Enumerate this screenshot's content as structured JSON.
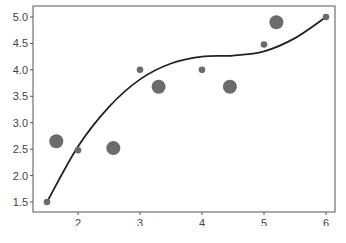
{
  "chart_data": {
    "type": "scatter",
    "title": "",
    "xlabel": "",
    "ylabel": "",
    "xlim": [
      1.3,
      6.2
    ],
    "ylim": [
      1.3,
      5.2
    ],
    "x_ticks": [
      2,
      3,
      4,
      5,
      6
    ],
    "x_tick_labels": [
      "2",
      "3",
      "4",
      "5",
      "6"
    ],
    "y_ticks": [
      1.5,
      2.0,
      2.5,
      3.0,
      3.5,
      4.0,
      4.5,
      5.0
    ],
    "y_tick_labels": [
      "1.5",
      "2.0",
      "2.5",
      "3.0",
      "3.5",
      "4.0",
      "4.5",
      "5.0"
    ],
    "grid": false,
    "legend": null,
    "series": [
      {
        "name": "points",
        "type": "scatter",
        "color": "#6b6b6b",
        "points": [
          {
            "x": 1.5,
            "y": 1.5,
            "size": "small"
          },
          {
            "x": 1.65,
            "y": 2.65,
            "size": "large"
          },
          {
            "x": 2.0,
            "y": 2.48,
            "size": "small"
          },
          {
            "x": 2.57,
            "y": 2.52,
            "size": "large"
          },
          {
            "x": 3.0,
            "y": 4.0,
            "size": "small"
          },
          {
            "x": 3.3,
            "y": 3.68,
            "size": "large"
          },
          {
            "x": 4.0,
            "y": 4.0,
            "size": "small"
          },
          {
            "x": 4.45,
            "y": 3.68,
            "size": "large"
          },
          {
            "x": 5.0,
            "y": 4.48,
            "size": "small"
          },
          {
            "x": 5.2,
            "y": 4.9,
            "size": "large"
          },
          {
            "x": 6.0,
            "y": 5.0,
            "size": "small"
          }
        ]
      },
      {
        "name": "fit-curve",
        "type": "line",
        "color": "#222222",
        "x": [
          1.5,
          2.0,
          2.5,
          3.0,
          3.5,
          4.0,
          4.5,
          5.0,
          5.5,
          6.0
        ],
        "y": [
          1.5,
          2.55,
          3.3,
          3.82,
          4.12,
          4.25,
          4.27,
          4.35,
          4.6,
          5.0
        ]
      }
    ],
    "caption": ""
  }
}
